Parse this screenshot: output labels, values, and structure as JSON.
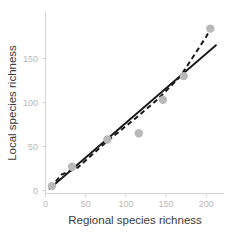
{
  "chart_data": {
    "type": "scatter",
    "title": "",
    "xlabel": "Regional species richness",
    "ylabel": "Local species richness",
    "xlim": [
      -6,
      218
    ],
    "ylim": [
      -8,
      196
    ],
    "xticks": [
      0,
      50,
      100,
      150,
      200
    ],
    "yticks": [
      0,
      50,
      100,
      150
    ],
    "xtick_labels": [
      "0",
      "50",
      "100",
      "150",
      "200"
    ],
    "ytick_labels": [
      "0",
      "50",
      "100",
      "150"
    ],
    "grid": false,
    "legend": "none",
    "point_color": "#b9b9b9",
    "line_color": "#1a1a1a",
    "axis_color": "#d4d4d4",
    "tick_label_color": "#b7b7b7",
    "axis_title_color": "#3a3a3a",
    "series": [
      {
        "name": "observed",
        "marker": "circle",
        "x": [
          8,
          33,
          77,
          116,
          146,
          172,
          205
        ],
        "y": [
          5,
          27,
          58,
          65,
          103,
          130,
          184
        ]
      },
      {
        "name": "linear-fit",
        "style": "solid",
        "x": [
          5,
          212
        ],
        "y": [
          2,
          165
        ]
      },
      {
        "name": "alternative-fit",
        "style": "dashed",
        "x": [
          6,
          20,
          40,
          78,
          112,
          140,
          168,
          200,
          209
        ],
        "y": [
          3,
          18,
          26,
          57,
          82,
          104,
          130,
          175,
          190
        ]
      }
    ]
  },
  "axis": {
    "x_title": "Regional species richness",
    "y_title": "Local species richness"
  }
}
